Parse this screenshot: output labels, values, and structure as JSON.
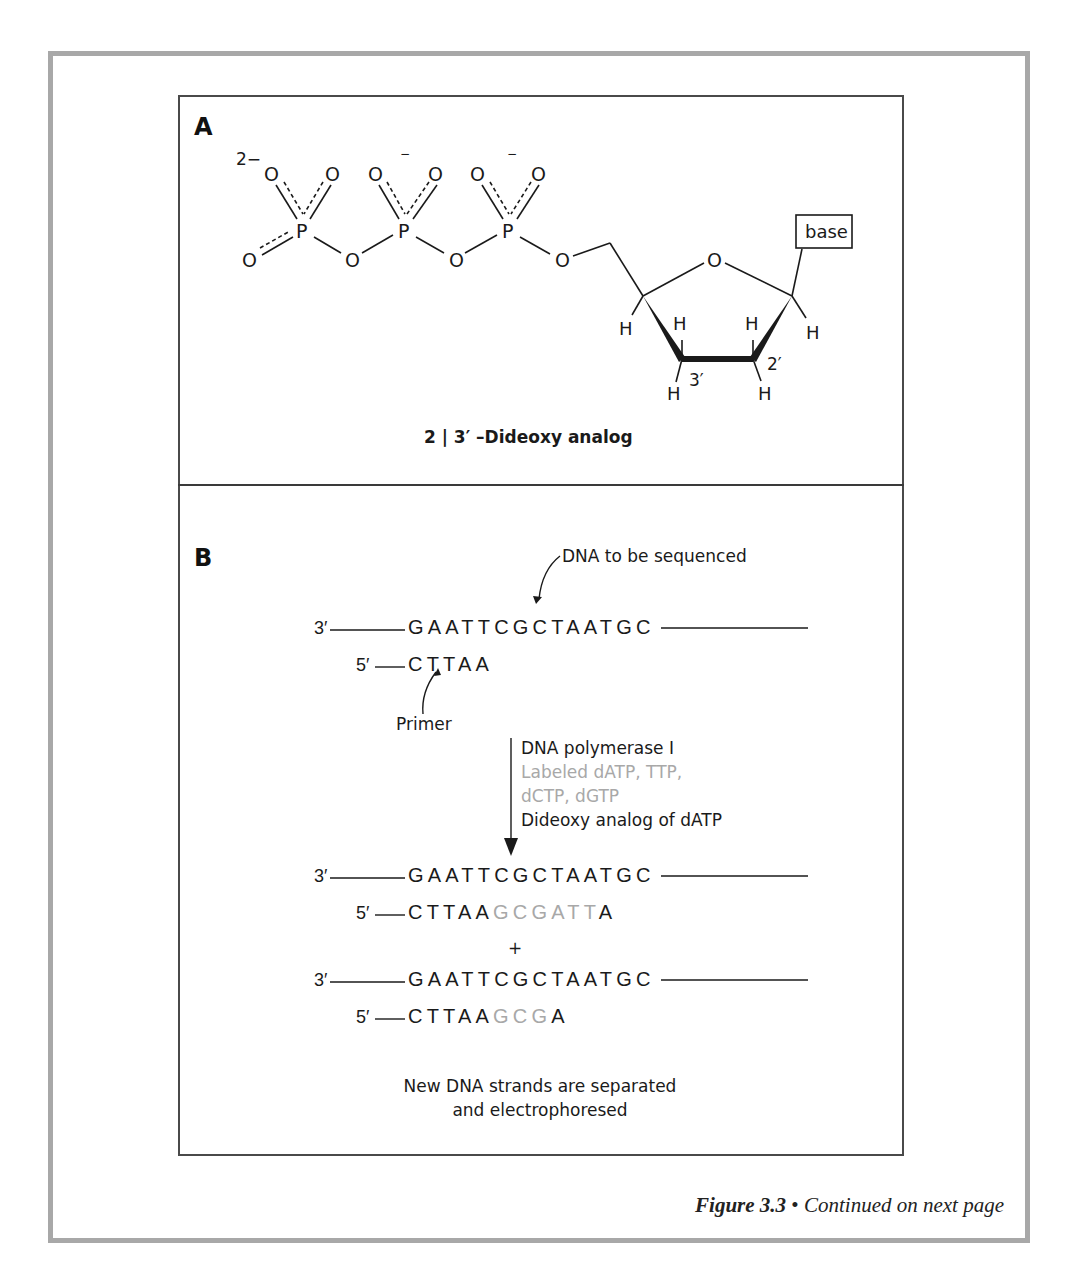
{
  "figure": {
    "number_label": "Figure 3.3",
    "bullet": "•",
    "continuation": "Continued on next page"
  },
  "panel_a": {
    "label": "A",
    "charge_labels": [
      "2−",
      "−",
      "−"
    ],
    "atoms": {
      "oxygen": "O",
      "phosphorus": "P",
      "hydrogen": "H",
      "base": "base"
    },
    "position_labels": [
      "3′",
      "2′"
    ],
    "title": "2 | 3′ –Dideoxy analog"
  },
  "panel_b": {
    "label": "B",
    "template_annotation": "DNA to be sequenced",
    "primer_annotation": "Primer",
    "initial": {
      "template_end": "3′",
      "template_seq": "GAATTCGCTAATGC",
      "primer_end": "5′",
      "primer_seq": "CTTAA"
    },
    "reaction": {
      "enzyme": "DNA polymerase I",
      "labeled_line1": "Labeled dATP, TTP,",
      "labeled_line2": "dCTP, dGTP",
      "terminator": "Dideoxy analog of dATP"
    },
    "products": [
      {
        "template_end": "3′",
        "template_seq": "GAATTCGCTAATGC",
        "primer_end": "5′",
        "primer_seq": "CTTAA",
        "new_seq": "GCGATT",
        "terminal_base": "A"
      },
      {
        "template_end": "3′",
        "template_seq": "GAATTCGCTAATGC",
        "primer_end": "5′",
        "primer_seq": "CTTAA",
        "new_seq": "GCG",
        "terminal_base": "A"
      }
    ],
    "plus": "+",
    "conclusion_line1": "New DNA strands are separated",
    "conclusion_line2": "and electrophoresed"
  },
  "colors": {
    "frame": "#a8a8a8",
    "box_border": "#4a4a4a",
    "text": "#1a1a1a",
    "labeled_text": "#a8a8a8"
  }
}
